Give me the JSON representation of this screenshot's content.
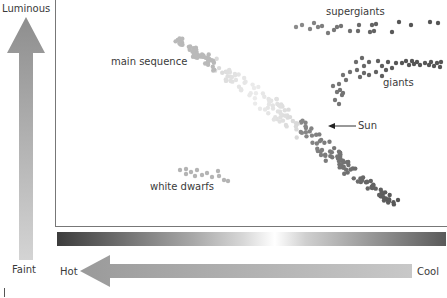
{
  "axes": {
    "y_top_label": "Luminous",
    "y_bottom_label": "Faint",
    "x_left_label": "Hot",
    "x_right_label": "Cool"
  },
  "regions": {
    "main_sequence": "main sequence",
    "supergiants": "supergiants",
    "giants": "giants",
    "white_dwarfs": "white dwarfs",
    "sun": "Sun"
  },
  "colors": {
    "arrow_gray": "#a0a0a0",
    "axis_line": "#777777",
    "dot_hot": "#c8c8c8",
    "dot_mid": "#aaaaaa",
    "dot_cool": "#6a6a6a"
  },
  "chart_data": {
    "type": "scatter",
    "xlabel": "Temperature (Hot → Cool)",
    "ylabel": "Luminosity (Faint → Luminous)",
    "legend": [],
    "groups": [
      "main sequence",
      "supergiants",
      "giants",
      "white dwarfs"
    ],
    "annotations": [
      {
        "text": "Sun",
        "x": 0.58,
        "y": 0.55
      }
    ]
  }
}
